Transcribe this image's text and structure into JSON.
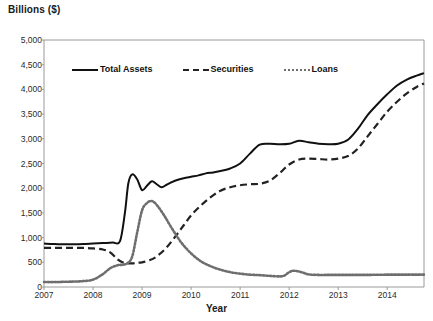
{
  "chart_data": {
    "type": "line",
    "title": "Billions ($)",
    "xlabel": "Year",
    "ylabel": "Billions ($)",
    "xlim": [
      2007,
      2014.75
    ],
    "ylim": [
      0,
      5000
    ],
    "ytick_values": [
      0,
      500,
      1000,
      1500,
      2000,
      2500,
      3000,
      3500,
      4000,
      4500,
      5000
    ],
    "ytick_labels": [
      "0",
      "500",
      "1,000",
      "1,500",
      "2,000",
      "2,500",
      "3,000",
      "3,500",
      "4,000",
      "4,500",
      "5,000"
    ],
    "xtick_values": [
      2007,
      2008,
      2009,
      2010,
      2011,
      2012,
      2013,
      2014
    ],
    "xtick_labels": [
      "2007",
      "2008",
      "2009",
      "2010",
      "2011",
      "2012",
      "2013",
      "2014"
    ],
    "grid": false,
    "legend_position": "upper-left-inside",
    "series": [
      {
        "name": "Total Assets",
        "style": "solid",
        "color": "#111111",
        "x": [
          2007.0,
          2007.2,
          2007.4,
          2007.6,
          2007.8,
          2008.0,
          2008.2,
          2008.4,
          2008.55,
          2008.65,
          2008.72,
          2008.8,
          2008.9,
          2009.0,
          2009.1,
          2009.2,
          2009.3,
          2009.4,
          2009.5,
          2009.6,
          2009.7,
          2009.85,
          2010.0,
          2010.15,
          2010.3,
          2010.45,
          2010.6,
          2010.8,
          2011.0,
          2011.2,
          2011.4,
          2011.6,
          2011.8,
          2012.0,
          2012.2,
          2012.4,
          2012.6,
          2012.8,
          2013.0,
          2013.2,
          2013.4,
          2013.6,
          2013.8,
          2014.0,
          2014.2,
          2014.4,
          2014.6,
          2014.75
        ],
        "y": [
          880,
          870,
          865,
          865,
          870,
          880,
          890,
          900,
          930,
          1500,
          2100,
          2280,
          2180,
          1960,
          2050,
          2140,
          2080,
          2020,
          2070,
          2120,
          2160,
          2200,
          2230,
          2260,
          2300,
          2320,
          2350,
          2400,
          2500,
          2700,
          2880,
          2900,
          2890,
          2900,
          2960,
          2930,
          2900,
          2890,
          2900,
          2980,
          3200,
          3480,
          3700,
          3900,
          4080,
          4200,
          4280,
          4330
        ]
      },
      {
        "name": "Securities",
        "style": "dashed",
        "color": "#222222",
        "x": [
          2007.0,
          2007.2,
          2007.4,
          2007.6,
          2007.8,
          2008.0,
          2008.2,
          2008.35,
          2008.5,
          2008.6,
          2008.7,
          2008.8,
          2008.9,
          2009.0,
          2009.15,
          2009.3,
          2009.5,
          2009.7,
          2009.85,
          2010.0,
          2010.2,
          2010.4,
          2010.6,
          2010.8,
          2011.0,
          2011.2,
          2011.4,
          2011.6,
          2011.8,
          2012.0,
          2012.2,
          2012.4,
          2012.6,
          2012.8,
          2013.0,
          2013.2,
          2013.4,
          2013.6,
          2013.8,
          2014.0,
          2014.2,
          2014.4,
          2014.6,
          2014.75
        ],
        "y": [
          790,
          790,
          790,
          790,
          790,
          780,
          760,
          700,
          560,
          500,
          480,
          480,
          490,
          500,
          540,
          620,
          800,
          1050,
          1250,
          1450,
          1650,
          1820,
          1950,
          2020,
          2060,
          2080,
          2090,
          2150,
          2300,
          2480,
          2580,
          2600,
          2590,
          2580,
          2600,
          2650,
          2800,
          3050,
          3300,
          3550,
          3750,
          3920,
          4050,
          4120
        ]
      },
      {
        "name": "Loans",
        "style": "dotted",
        "color": "#6e6e6e",
        "x": [
          2007.0,
          2007.2,
          2007.4,
          2007.6,
          2007.8,
          2008.0,
          2008.2,
          2008.35,
          2008.5,
          2008.6,
          2008.7,
          2008.8,
          2008.9,
          2009.0,
          2009.1,
          2009.2,
          2009.3,
          2009.45,
          2009.6,
          2009.8,
          2010.0,
          2010.2,
          2010.4,
          2010.6,
          2010.8,
          2011.0,
          2011.2,
          2011.4,
          2011.6,
          2011.8,
          2011.9,
          2012.0,
          2012.1,
          2012.25,
          2012.4,
          2012.6,
          2012.8,
          2013.0,
          2013.2,
          2013.4,
          2013.6,
          2013.8,
          2014.0,
          2014.2,
          2014.4,
          2014.6,
          2014.75
        ],
        "y": [
          100,
          100,
          105,
          110,
          120,
          150,
          260,
          380,
          440,
          450,
          480,
          620,
          1100,
          1550,
          1700,
          1740,
          1660,
          1450,
          1200,
          900,
          680,
          520,
          420,
          350,
          300,
          270,
          250,
          240,
          225,
          215,
          230,
          300,
          330,
          300,
          255,
          245,
          245,
          245,
          245,
          245,
          245,
          248,
          250,
          250,
          250,
          250,
          250
        ]
      }
    ]
  },
  "legend": {
    "items": [
      {
        "label": "Total Assets",
        "style": "solid"
      },
      {
        "label": "Securities",
        "style": "dashed"
      },
      {
        "label": "Loans",
        "style": "dotted"
      }
    ]
  }
}
